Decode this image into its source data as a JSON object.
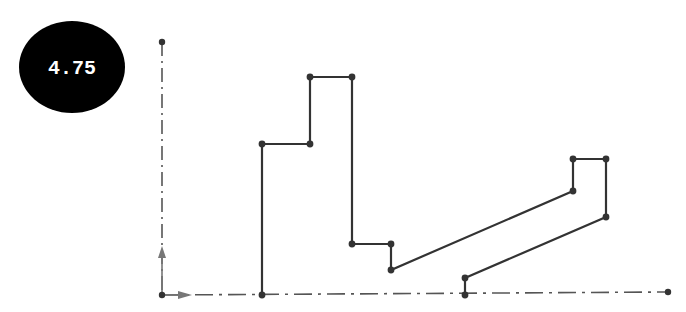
{
  "badge": {
    "label": "4.75",
    "fill": "#000000",
    "text_color": "#ffffff",
    "cx": 72,
    "cy": 67,
    "rx": 53,
    "ry": 46
  },
  "axes": {
    "color": "#555555",
    "origin": [
      162,
      295
    ],
    "y_axis_end": [
      162,
      42
    ],
    "x_axis_end": [
      668,
      291
    ],
    "style": "dash-dot"
  },
  "shape": {
    "stroke": "#333333",
    "points": [
      [
        262,
        295
      ],
      [
        262,
        144
      ],
      [
        310,
        144
      ],
      [
        310,
        77
      ],
      [
        352,
        77
      ],
      [
        352,
        244
      ],
      [
        391,
        244
      ],
      [
        391,
        270
      ],
      [
        573,
        191
      ],
      [
        573,
        159
      ],
      [
        606,
        159
      ],
      [
        606,
        217
      ],
      [
        465,
        278
      ],
      [
        465,
        295
      ]
    ]
  }
}
